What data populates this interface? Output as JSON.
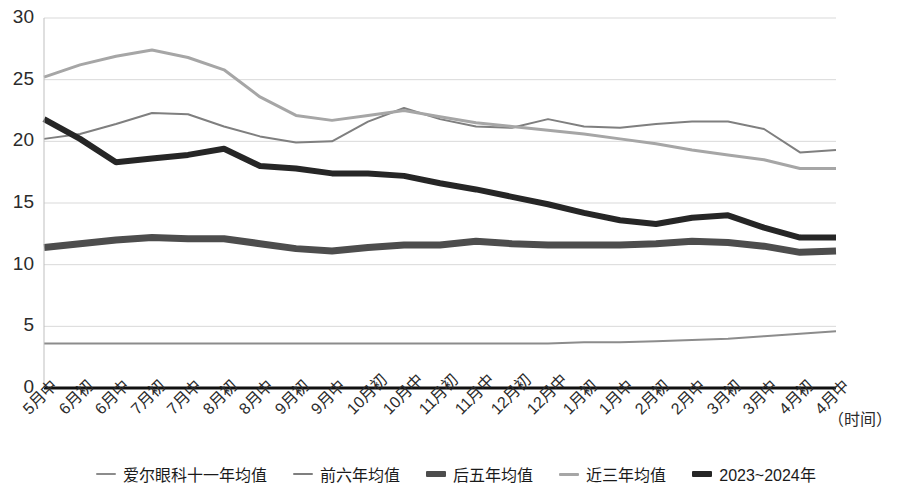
{
  "chart_data": {
    "type": "line",
    "title": "",
    "xlabel": "（时间）",
    "ylabel": "",
    "ylim": [
      0,
      30
    ],
    "yticks": [
      0,
      5,
      10,
      15,
      20,
      25,
      30
    ],
    "grid": true,
    "legend_position": "bottom",
    "categories": [
      "5月中",
      "6月初",
      "6月中",
      "7月初",
      "7月中",
      "8月初",
      "8月中",
      "9月初",
      "9月中",
      "10月初",
      "10月中",
      "11月初",
      "11月中",
      "12月初",
      "12月中",
      "1月初",
      "1月中",
      "2月初",
      "2月中",
      "3月初",
      "3月中",
      "4月初",
      "4月中"
    ],
    "series": [
      {
        "name": "爱尔眼科十一年均值",
        "color": "#8c8c8c",
        "width": 2,
        "values": [
          3.6,
          3.6,
          3.6,
          3.6,
          3.6,
          3.6,
          3.6,
          3.6,
          3.6,
          3.6,
          3.6,
          3.6,
          3.6,
          3.6,
          3.6,
          3.7,
          3.7,
          3.8,
          3.9,
          4.0,
          4.2,
          4.4,
          4.6
        ]
      },
      {
        "name": "前六年均值",
        "color": "#7f7f7f",
        "width": 2,
        "values": [
          20.2,
          20.6,
          21.4,
          22.3,
          22.2,
          21.2,
          20.4,
          19.9,
          20.0,
          21.6,
          22.7,
          21.8,
          21.2,
          21.1,
          21.8,
          21.2,
          21.1,
          21.4,
          21.6,
          21.6,
          21.0,
          19.1,
          19.3
        ]
      },
      {
        "name": "后五年均值",
        "color": "#4d4d4d",
        "width": 7,
        "values": [
          11.4,
          11.7,
          12.0,
          12.2,
          12.1,
          12.1,
          11.7,
          11.3,
          11.1,
          11.4,
          11.6,
          11.6,
          11.9,
          11.7,
          11.6,
          11.6,
          11.6,
          11.7,
          11.9,
          11.8,
          11.5,
          11.0,
          11.1
        ]
      },
      {
        "name": "近三年均值",
        "color": "#a6a6a6",
        "width": 3,
        "values": [
          25.2,
          26.2,
          26.9,
          27.4,
          26.8,
          25.8,
          23.6,
          22.1,
          21.7,
          22.1,
          22.5,
          22.0,
          21.5,
          21.2,
          20.9,
          20.6,
          20.2,
          19.8,
          19.3,
          18.9,
          18.5,
          17.8,
          17.8
        ]
      },
      {
        "name": "2023~2024年",
        "color": "#262626",
        "width": 6,
        "values": [
          21.8,
          20.2,
          18.3,
          18.6,
          18.9,
          19.4,
          18.0,
          17.8,
          17.4,
          17.4,
          17.2,
          16.6,
          16.1,
          15.5,
          14.9,
          14.2,
          13.6,
          13.3,
          13.8,
          14.0,
          13.0,
          12.2,
          12.2
        ]
      }
    ]
  },
  "axis": {
    "y_tick_labels": [
      "30",
      "25",
      "20",
      "15",
      "10",
      "5",
      "0"
    ],
    "x_axis_title": "（时间）"
  }
}
